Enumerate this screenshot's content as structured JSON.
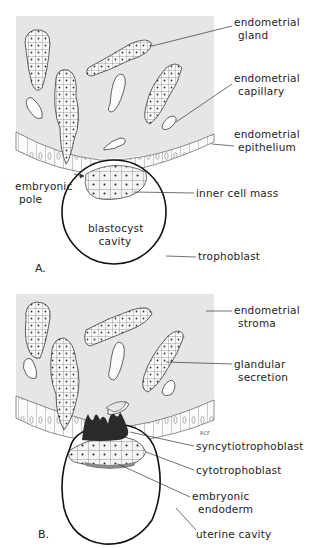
{
  "figure": {
    "panels": [
      {
        "letter": "A.",
        "labels": {
          "endometrial_gland": [
            "endometrial",
            "gland"
          ],
          "endometrial_capillary": [
            "endometrial",
            "capillary"
          ],
          "endometrial_epithelium": [
            "endometrial",
            "epithelium"
          ],
          "embryonic_pole": [
            "embryonic",
            "pole"
          ],
          "inner_cell_mass": "inner cell mass",
          "blastocyst_cavity": [
            "blastocyst",
            "cavity"
          ],
          "trophoblast": "trophoblast"
        }
      },
      {
        "letter": "B.",
        "labels": {
          "endometrial_stroma": [
            "endometrial",
            "stroma"
          ],
          "glandular_secretion": [
            "glandular",
            "secretion"
          ],
          "syncytiotrophoblast": "syncytiotrophoblast",
          "cytotrophoblast": "cytotrophoblast",
          "embryonic_endoderm": [
            "embryonic",
            "endoderm"
          ],
          "uterine_cavity": "uterine cavity"
        }
      }
    ],
    "signature": "RCF",
    "colors": {
      "stroma": "#e6e6e6",
      "ink": "#1a1a1a",
      "background": "#ffffff",
      "syncytio": "#2a2a2a"
    }
  }
}
